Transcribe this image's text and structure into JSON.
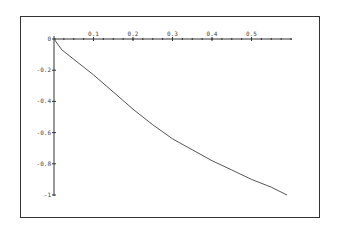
{
  "chart_data": {
    "type": "line",
    "title": "",
    "xlabel": "",
    "ylabel": "",
    "x_ticks": [
      "0.1",
      "0.2",
      "0.3",
      "0.4",
      "0.5"
    ],
    "y_ticks": [
      "0",
      "-0.2",
      "-0.4",
      "-0.6",
      "-0.8",
      "-1"
    ],
    "xlim": [
      0,
      0.6
    ],
    "ylim": [
      -1,
      0
    ],
    "grid": false,
    "legend": null,
    "series": [
      {
        "name": "curve",
        "x": [
          0,
          0.02,
          0.05,
          0.1,
          0.15,
          0.2,
          0.25,
          0.3,
          0.35,
          0.4,
          0.45,
          0.5,
          0.55,
          0.59
        ],
        "y": [
          0,
          -0.07,
          -0.13,
          -0.23,
          -0.34,
          -0.45,
          -0.55,
          -0.64,
          -0.71,
          -0.78,
          -0.84,
          -0.9,
          -0.95,
          -1.0
        ]
      }
    ]
  }
}
